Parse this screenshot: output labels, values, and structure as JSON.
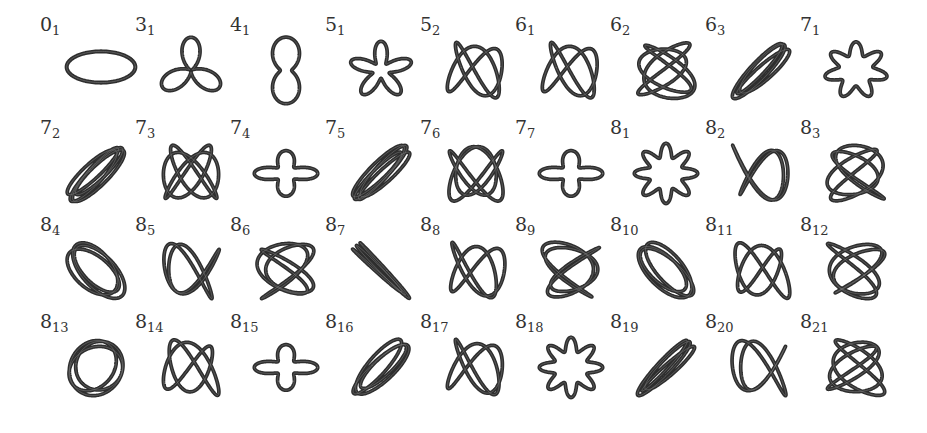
{
  "figure": {
    "rows": [
      [
        {
          "crossings": "0",
          "index": "1",
          "shape": "unknot"
        },
        {
          "crossings": "3",
          "index": "1",
          "shape": "trefoil"
        },
        {
          "crossings": "4",
          "index": "1",
          "shape": "figure8"
        },
        {
          "crossings": "5",
          "index": "1",
          "shape": "star5"
        },
        {
          "crossings": "5",
          "index": "2",
          "shape": "twist"
        },
        {
          "crossings": "6",
          "index": "1",
          "shape": "twist"
        },
        {
          "crossings": "6",
          "index": "2",
          "shape": "twist"
        },
        {
          "crossings": "6",
          "index": "3",
          "shape": "twist"
        },
        {
          "crossings": "7",
          "index": "1",
          "shape": "torus7"
        }
      ],
      [
        {
          "crossings": "7",
          "index": "2",
          "shape": "twist"
        },
        {
          "crossings": "7",
          "index": "3",
          "shape": "twist"
        },
        {
          "crossings": "7",
          "index": "4",
          "shape": "pretzel"
        },
        {
          "crossings": "7",
          "index": "5",
          "shape": "twist"
        },
        {
          "crossings": "7",
          "index": "6",
          "shape": "twist"
        },
        {
          "crossings": "7",
          "index": "7",
          "shape": "pretzel"
        },
        {
          "crossings": "8",
          "index": "1",
          "shape": "torus8"
        },
        {
          "crossings": "8",
          "index": "2",
          "shape": "twist"
        },
        {
          "crossings": "8",
          "index": "3",
          "shape": "twist"
        }
      ],
      [
        {
          "crossings": "8",
          "index": "4",
          "shape": "twist"
        },
        {
          "crossings": "8",
          "index": "5",
          "shape": "twist"
        },
        {
          "crossings": "8",
          "index": "6",
          "shape": "twist"
        },
        {
          "crossings": "8",
          "index": "7",
          "shape": "twist"
        },
        {
          "crossings": "8",
          "index": "8",
          "shape": "twist"
        },
        {
          "crossings": "8",
          "index": "9",
          "shape": "twist"
        },
        {
          "crossings": "8",
          "index": "10",
          "shape": "twist"
        },
        {
          "crossings": "8",
          "index": "11",
          "shape": "twist"
        },
        {
          "crossings": "8",
          "index": "12",
          "shape": "twist"
        }
      ],
      [
        {
          "crossings": "8",
          "index": "13",
          "shape": "twist"
        },
        {
          "crossings": "8",
          "index": "14",
          "shape": "twist"
        },
        {
          "crossings": "8",
          "index": "15",
          "shape": "pretzel"
        },
        {
          "crossings": "8",
          "index": "16",
          "shape": "twist"
        },
        {
          "crossings": "8",
          "index": "17",
          "shape": "twist"
        },
        {
          "crossings": "8",
          "index": "18",
          "shape": "torus8"
        },
        {
          "crossings": "8",
          "index": "19",
          "shape": "twist"
        },
        {
          "crossings": "8",
          "index": "20",
          "shape": "twist"
        },
        {
          "crossings": "8",
          "index": "21",
          "shape": "twist"
        }
      ]
    ]
  },
  "colors": {
    "background": "#ffffff",
    "strand": "#2e2e2e",
    "label": "#333333"
  }
}
